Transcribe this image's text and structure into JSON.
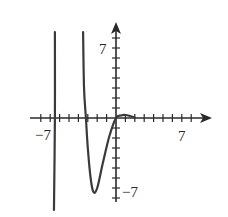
{
  "chart_data": {
    "type": "line",
    "title": "",
    "xlabel": "",
    "ylabel": "",
    "xlim": [
      -7.5,
      9.5
    ],
    "ylim": [
      -9.5,
      9
    ],
    "grid": false,
    "legend": null,
    "tick_labels": {
      "x": [
        "-7",
        "7"
      ],
      "y": [
        "7",
        "-7"
      ]
    },
    "x_tick_step": 1,
    "y_tick_step": 1,
    "series": [
      {
        "name": "left branch (near-vertical asymptote)",
        "points": [
          [
            -6.5,
            8.6
          ],
          [
            -6.5,
            0
          ],
          [
            -6.6,
            -9.2
          ]
        ]
      },
      {
        "name": "right branch",
        "points": [
          [
            -3.5,
            8.6
          ],
          [
            -3.4,
            3
          ],
          [
            -3.2,
            0
          ],
          [
            -3.0,
            -3
          ],
          [
            -2.7,
            -6
          ],
          [
            -2.4,
            -7.4
          ],
          [
            -2.0,
            -7.0
          ],
          [
            -1.4,
            -4.5
          ],
          [
            -0.7,
            -1.8
          ],
          [
            0,
            0
          ],
          [
            0.5,
            0.25
          ],
          [
            1.0,
            0.3
          ],
          [
            1.5,
            0.2
          ],
          [
            2.0,
            0.05
          ]
        ]
      }
    ],
    "labels": {
      "x_neg": "−7",
      "x_pos": "7",
      "y_pos": "7",
      "y_neg": "−7"
    }
  }
}
